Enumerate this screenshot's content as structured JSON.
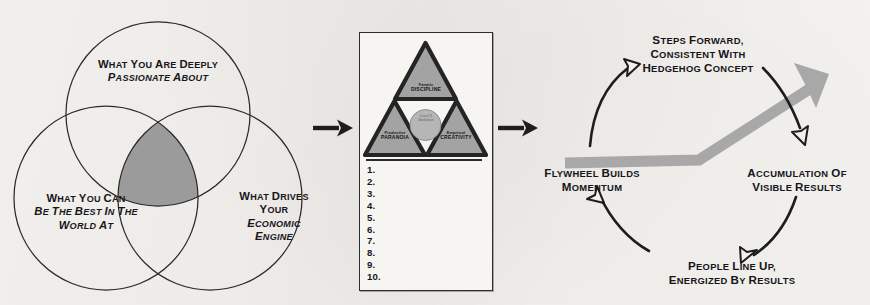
{
  "page": {
    "background_color": "#f5f3f0",
    "ink_color": "#17171a",
    "accent_gray": "#9a9a9a"
  },
  "venn": {
    "name": "hedgehog-concept-venn",
    "intersection_fill": "#9b9b9b",
    "circle_stroke": "#2a2a2a",
    "circles": [
      {
        "id": "passionate",
        "position": "top",
        "lines": [
          {
            "text": "WHAT YOU ARE DEEPLY",
            "style": "regular"
          },
          {
            "text": "PASSIONATE ABOUT",
            "style": "italic"
          }
        ]
      },
      {
        "id": "best-in-world",
        "position": "bottom-left",
        "lines": [
          {
            "text": "WHAT YOU CAN",
            "style": "mixed"
          },
          {
            "text": "BE THE BEST IN THE",
            "style": "italic"
          },
          {
            "text": "WORLD AT",
            "style": "mixed"
          }
        ]
      },
      {
        "id": "economic-engine",
        "position": "bottom-right",
        "lines": [
          {
            "text": "WHAT DRIVES",
            "style": "regular"
          },
          {
            "text": "YOUR",
            "style": "regular"
          },
          {
            "text": "ECONOMIC",
            "style": "italic"
          },
          {
            "text": "ENGINE",
            "style": "italic"
          }
        ]
      }
    ]
  },
  "connectors": [
    {
      "name": "connector-arrow-1",
      "icon": "right-arrow-icon",
      "color": "#1d1d1d"
    },
    {
      "name": "connector-arrow-2",
      "icon": "right-arrow-icon",
      "color": "#1d1d1d"
    }
  ],
  "triangle_panel": {
    "name": "great-by-choice-triangle-panel",
    "triangle_fill": "#a3a3a3",
    "triangle_stroke": "#242424",
    "corners": [
      {
        "id": "discipline",
        "position": "top",
        "small": "Fanatic",
        "big": "DISCIPLINE"
      },
      {
        "id": "paranoia",
        "position": "bottom-left",
        "small": "Productive",
        "big": "PARANOIA"
      },
      {
        "id": "creativity",
        "position": "bottom-right",
        "small": "Empirical",
        "big": "CREATIVITY"
      }
    ],
    "center": {
      "id": "level-5-ambition",
      "fill": "#b6b6b6",
      "lines": [
        "Level 5",
        "Ambition"
      ]
    },
    "list": {
      "name": "numbered-list",
      "items": [
        "1.",
        "2.",
        "3.",
        "4.",
        "5.",
        "6.",
        "7.",
        "8.",
        "9.",
        "10."
      ]
    }
  },
  "flywheel": {
    "name": "flywheel-cycle",
    "arrow_fill": "#a8a8a8",
    "cycle_arrow_color": "#1d1d1d",
    "entry_arrow": {
      "name": "entry-arrow",
      "icon": "right-arrow-icon"
    },
    "labels": [
      {
        "id": "steps-forward",
        "position": "top",
        "lines": [
          "STEPS FORWARD,",
          "CONSISTENT WITH",
          "HEDGEHOG CONCEPT"
        ]
      },
      {
        "id": "flywheel-momentum",
        "position": "left",
        "lines": [
          "FLYWHEEL BUILDS",
          "MOMENTUM"
        ]
      },
      {
        "id": "accumulation-results",
        "position": "right",
        "lines": [
          "ACCUMULATION OF",
          "VISIBLE RESULTS"
        ]
      },
      {
        "id": "people-line-up",
        "position": "bottom",
        "lines": [
          "PEOPLE LINE UP,",
          "ENERGIZED BY RESULTS"
        ]
      }
    ]
  }
}
